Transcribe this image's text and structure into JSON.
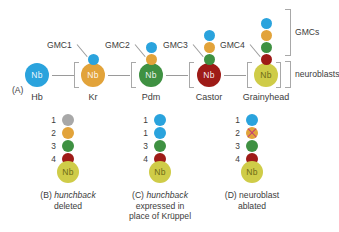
{
  "colors": {
    "blue": "#2aa3dd",
    "orange": "#e2a33a",
    "green": "#3f9142",
    "darkred": "#9e1b17",
    "olive": "#cfcc48",
    "gray": "#a8a8a8",
    "line": "#9a9a9a",
    "bracket": "#a8a8a8",
    "text": "#3c3c3c",
    "cross": "#c0397a"
  },
  "panelA": {
    "tag": "(A)",
    "nb_label": "Nb",
    "stages": [
      {
        "name": "Hb",
        "color_key": "blue",
        "gmc_stack": []
      },
      {
        "name": "Kr",
        "color_key": "orange",
        "gmc_stack": [
          "blue"
        ]
      },
      {
        "name": "Pdm",
        "color_key": "green",
        "gmc_stack": [
          "blue",
          "orange"
        ]
      },
      {
        "name": "Castor",
        "color_key": "darkred",
        "gmc_stack": [
          "blue",
          "orange",
          "green"
        ]
      },
      {
        "name": "Grainyhead",
        "color_key": "olive",
        "gmc_stack": [
          "blue",
          "orange",
          "green",
          "darkred"
        ]
      }
    ],
    "gmc_labels": [
      "GMC1",
      "GMC2",
      "GMC3",
      "GMC4"
    ],
    "side_labels": {
      "gmcs": "GMCs",
      "neuroblasts": "neuroblasts"
    }
  },
  "panels": [
    {
      "tag": "(B)",
      "caption_italic": "hunchback",
      "caption_rest": "deleted",
      "nb_label": "Nb",
      "nb_color_key": "olive",
      "numbers": [
        "1",
        "2",
        "3",
        "4"
      ],
      "stack": [
        {
          "color_key": "gray",
          "crossed": false
        },
        {
          "color_key": "orange",
          "crossed": false
        },
        {
          "color_key": "green",
          "crossed": false
        },
        {
          "color_key": "darkred",
          "crossed": false
        }
      ]
    },
    {
      "tag": "(C)",
      "caption_italic": "hunchback",
      "caption_rest": "expressed in\nplace of Krüppel",
      "nb_label": "Nb",
      "nb_color_key": "olive",
      "numbers": [
        "1",
        "1",
        "3",
        "4"
      ],
      "stack": [
        {
          "color_key": "blue",
          "crossed": false
        },
        {
          "color_key": "blue",
          "crossed": false
        },
        {
          "color_key": "green",
          "crossed": false
        },
        {
          "color_key": "darkred",
          "crossed": false
        }
      ]
    },
    {
      "tag": "(D)",
      "caption_italic": "",
      "caption_rest": "neuroblast\nablated",
      "nb_label": "Nb",
      "nb_color_key": "olive",
      "numbers": [
        "1",
        "2",
        "3",
        "4"
      ],
      "stack": [
        {
          "color_key": "blue",
          "crossed": false
        },
        {
          "color_key": "orange",
          "crossed": true
        },
        {
          "color_key": "green",
          "crossed": false
        },
        {
          "color_key": "darkred",
          "crossed": false
        }
      ]
    }
  ]
}
